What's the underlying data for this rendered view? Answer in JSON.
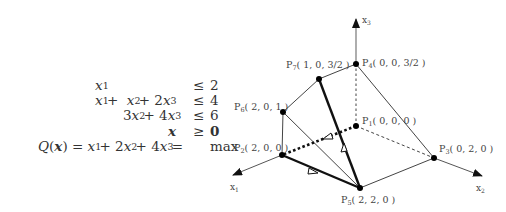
{
  "problem": {
    "constraints": [
      {
        "lhs": "x₁",
        "rel": "≤",
        "rhs": "2"
      },
      {
        "lhs": "x₁ + x₂ + 2x₃",
        "rel": "≤",
        "rhs": "4"
      },
      {
        "lhs": "3x₂ + 4x₃",
        "rel": "≤",
        "rhs": "6"
      },
      {
        "lhs": "x",
        "rel": "≥",
        "rhs": "0"
      }
    ],
    "objective": {
      "lhs": "Q(x)",
      "expr": "x₁ + 2x₂ + 4x₃",
      "goal": "max"
    }
  },
  "diagram": {
    "axes": [
      {
        "label": "x₁",
        "main": "x",
        "sub": "1"
      },
      {
        "label": "x₂",
        "main": "x",
        "sub": "2"
      },
      {
        "label": "x₃",
        "main": "x",
        "sub": "3"
      }
    ],
    "vertices": [
      {
        "id": "P1",
        "main": "P",
        "sub": "1",
        "coords": "( 0, 0, 0 )"
      },
      {
        "id": "P2",
        "main": "P",
        "sub": "2",
        "coords": "( 2, 0, 0 )"
      },
      {
        "id": "P3",
        "main": "P",
        "sub": "3",
        "coords": "( 0, 2, 0 )"
      },
      {
        "id": "P4",
        "main": "P",
        "sub": "4",
        "coords": "( 0, 0, 3/2 )"
      },
      {
        "id": "P5",
        "main": "P",
        "sub": "5",
        "coords": "( 2, 2, 0 )"
      },
      {
        "id": "P6",
        "main": "P",
        "sub": "6",
        "coords": "( 2, 0, 1 )"
      },
      {
        "id": "P7",
        "main": "P",
        "sub": "7",
        "coords": "( 1, 0, 3/2 )"
      }
    ],
    "simplex_path": [
      "P1",
      "P2",
      "P5",
      "P7"
    ]
  }
}
